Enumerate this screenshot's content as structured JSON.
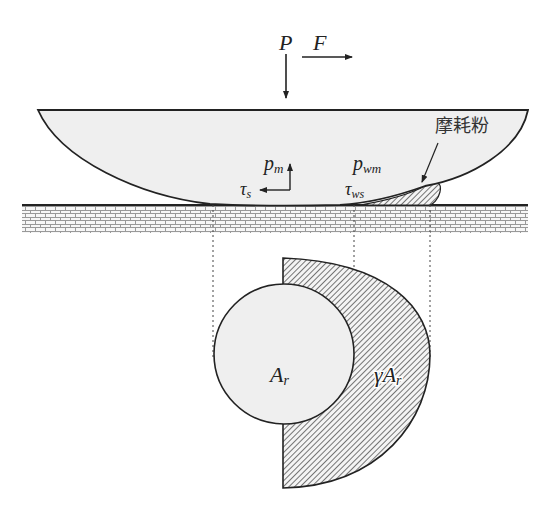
{
  "diagram": {
    "forces": {
      "normal_load": "P",
      "friction_force": "F"
    },
    "contact_labels": {
      "pressure_real": "p",
      "pressure_real_sub": "m",
      "pressure_wear": "p",
      "pressure_wear_sub": "wm",
      "shear_real": "τ",
      "shear_real_sub": "s",
      "shear_wear": "τ",
      "shear_wear_sub": "ws"
    },
    "wear_debris_label": "摩耗粉",
    "areas": {
      "real_area": "A",
      "real_area_sub": "r",
      "wear_area_prefix": "γA",
      "wear_area_sub": "r"
    },
    "colors": {
      "slider_fill": "#efefef",
      "outline": "#222222",
      "hatch": "#555555",
      "ground_brick": "#888888"
    }
  }
}
